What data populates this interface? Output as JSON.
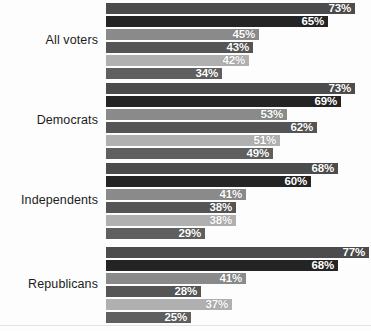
{
  "chart_data": {
    "type": "bar",
    "orientation": "horizontal",
    "title": "",
    "subtitle": "",
    "xlabel": "",
    "ylabel": "",
    "xlim": [
      0,
      80
    ],
    "grid": false,
    "legend": "none",
    "value_suffix": "%",
    "categories": [
      "All voters",
      "Democrats",
      "Independents",
      "Republicans"
    ],
    "series": [
      {
        "name": "Series 1",
        "color": "#4c4c4c",
        "values": [
          73,
          73,
          68,
          77
        ]
      },
      {
        "name": "Series 2",
        "color": "#242424",
        "values": [
          65,
          69,
          60,
          68
        ]
      },
      {
        "name": "Series 3",
        "color": "#8a8a8a",
        "values": [
          45,
          53,
          41,
          41
        ]
      },
      {
        "name": "Series 4",
        "color": "#555555",
        "values": [
          43,
          62,
          38,
          28
        ]
      },
      {
        "name": "Series 5",
        "color": "#b0b0b0",
        "values": [
          42,
          51,
          38,
          37
        ]
      },
      {
        "name": "Series 6",
        "color": "#5f5f5f",
        "values": [
          34,
          49,
          29,
          25
        ]
      }
    ],
    "groups": [
      {
        "label": "All voters",
        "bars": [
          {
            "value": 73,
            "label": "73%",
            "color": "#4c4c4c"
          },
          {
            "value": 65,
            "label": "65%",
            "color": "#242424"
          },
          {
            "value": 45,
            "label": "45%",
            "color": "#8a8a8a"
          },
          {
            "value": 43,
            "label": "43%",
            "color": "#555555"
          },
          {
            "value": 42,
            "label": "42%",
            "color": "#b0b0b0"
          },
          {
            "value": 34,
            "label": "34%",
            "color": "#5f5f5f"
          }
        ]
      },
      {
        "label": "Democrats",
        "bars": [
          {
            "value": 73,
            "label": "73%",
            "color": "#4c4c4c"
          },
          {
            "value": 69,
            "label": "69%",
            "color": "#242424"
          },
          {
            "value": 53,
            "label": "53%",
            "color": "#8a8a8a"
          },
          {
            "value": 62,
            "label": "62%",
            "color": "#555555"
          },
          {
            "value": 51,
            "label": "51%",
            "color": "#b0b0b0"
          },
          {
            "value": 49,
            "label": "49%",
            "color": "#5f5f5f"
          }
        ]
      },
      {
        "label": "Independents",
        "bars": [
          {
            "value": 68,
            "label": "68%",
            "color": "#4c4c4c"
          },
          {
            "value": 60,
            "label": "60%",
            "color": "#242424"
          },
          {
            "value": 41,
            "label": "41%",
            "color": "#8a8a8a"
          },
          {
            "value": 38,
            "label": "38%",
            "color": "#555555"
          },
          {
            "value": 38,
            "label": "38%",
            "color": "#b0b0b0"
          },
          {
            "value": 29,
            "label": "29%",
            "color": "#5f5f5f"
          }
        ]
      },
      {
        "label": "Republicans",
        "bars": [
          {
            "value": 77,
            "label": "77%",
            "color": "#4c4c4c"
          },
          {
            "value": 68,
            "label": "68%",
            "color": "#242424"
          },
          {
            "value": 41,
            "label": "41%",
            "color": "#8a8a8a"
          },
          {
            "value": 28,
            "label": "28%",
            "color": "#555555"
          },
          {
            "value": 37,
            "label": "37%",
            "color": "#b0b0b0"
          },
          {
            "value": 25,
            "label": "25%",
            "color": "#5f5f5f"
          }
        ]
      }
    ]
  },
  "layout": {
    "bar_origin_x": 106,
    "px_per_unit": 3.41,
    "bar_height": 11,
    "bar_gap": 2,
    "group_tops": [
      3,
      83,
      163,
      247
    ],
    "baseline_y": 325
  }
}
